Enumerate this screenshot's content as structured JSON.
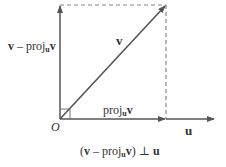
{
  "diagram": {
    "colors": {
      "line": "#555555",
      "dashed": "#888888",
      "text": "#333333"
    },
    "origin_label": "O",
    "u_label": "u",
    "v_label": "v",
    "proj_label": {
      "main": "proj",
      "sub": "u",
      "vec": "v"
    },
    "perp_label": {
      "vec": "v",
      "minus": " – ",
      "main": "proj",
      "sub": "u",
      "vec2": "v"
    },
    "caption": {
      "open": "(",
      "v": "v",
      "minus": " – ",
      "proj": "proj",
      "sub": "u",
      "v2": "v",
      "close": ")",
      "perp": " ⊥ ",
      "u": "u"
    }
  }
}
